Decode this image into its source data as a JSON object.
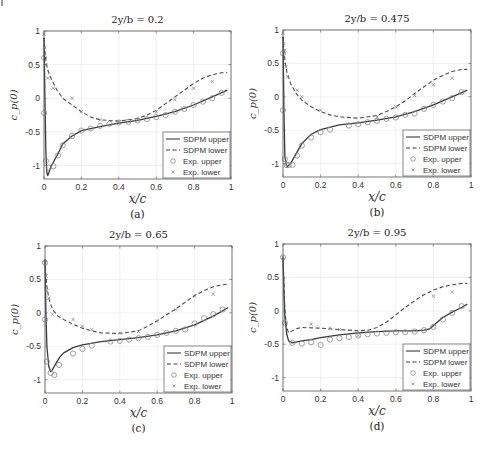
{
  "figure": {
    "colors": {
      "upper": "#3a3a3a",
      "lower": "#4a4a4a",
      "exp": "#888888",
      "grid": "#e6e6e6",
      "axis": "#555555"
    }
  },
  "chart_data": [
    {
      "type": "line",
      "caption": "(a)",
      "title": "2y/b = 0.2",
      "xlabel": "x/c",
      "ylabel": "c_p(0)",
      "xlim": [
        0,
        1
      ],
      "ylim": [
        -1.2,
        1
      ],
      "xticks": [
        0,
        0.2,
        0.4,
        0.6,
        0.8,
        1
      ],
      "xtick_labels": [
        "0",
        "0.2",
        "0.4",
        "0.6",
        "0.8",
        "1"
      ],
      "yticks": [
        -1,
        -0.5,
        0,
        0.5,
        1
      ],
      "ytick_labels": [
        "-1",
        "-0.5",
        "0",
        "0.5",
        "1"
      ],
      "grid": true,
      "legend": [
        "SDPM upper",
        "SDPM lower",
        "Exp. upper",
        "Exp. lower"
      ],
      "legend_position": "lower right",
      "series": [
        {
          "name": "SDPM upper",
          "style": "solid",
          "x": [
            0,
            0.005,
            0.01,
            0.015,
            0.02,
            0.04,
            0.07,
            0.1,
            0.15,
            0.2,
            0.3,
            0.4,
            0.5,
            0.6,
            0.7,
            0.8,
            0.9,
            0.98
          ],
          "y": [
            0.9,
            0.0,
            -0.8,
            -1.1,
            -1.15,
            -1.0,
            -0.85,
            -0.68,
            -0.56,
            -0.48,
            -0.42,
            -0.37,
            -0.33,
            -0.27,
            -0.2,
            -0.1,
            0.02,
            0.12
          ]
        },
        {
          "name": "SDPM lower",
          "style": "dashed",
          "x": [
            0,
            0.005,
            0.01,
            0.02,
            0.04,
            0.07,
            0.1,
            0.15,
            0.2,
            0.25,
            0.3,
            0.4,
            0.5,
            0.55,
            0.6,
            0.65,
            0.7,
            0.75,
            0.8,
            0.85,
            0.9,
            0.95,
            0.98
          ],
          "y": [
            0.9,
            0.7,
            0.55,
            0.42,
            0.28,
            0.12,
            0.0,
            -0.1,
            -0.2,
            -0.28,
            -0.32,
            -0.34,
            -0.3,
            -0.25,
            -0.18,
            -0.08,
            0.02,
            0.12,
            0.22,
            0.3,
            0.35,
            0.38,
            0.38
          ]
        },
        {
          "name": "Exp. upper",
          "style": "circle",
          "x": [
            0,
            0.0,
            0.01,
            0.025,
            0.05,
            0.075,
            0.1,
            0.15,
            0.2,
            0.25,
            0.3,
            0.35,
            0.4,
            0.45,
            0.5,
            0.55,
            0.6,
            0.65,
            0.7,
            0.75,
            0.8,
            0.85,
            0.9,
            0.95
          ],
          "y": [
            0.6,
            -0.22,
            -0.93,
            -1.03,
            -1.01,
            -0.85,
            -0.7,
            -0.56,
            -0.48,
            -0.45,
            -0.41,
            -0.38,
            -0.36,
            -0.35,
            -0.33,
            -0.31,
            -0.28,
            -0.25,
            -0.2,
            -0.16,
            -0.1,
            -0.05,
            0.0,
            0.08
          ]
        },
        {
          "name": "Exp. lower",
          "style": "x",
          "x": [
            0,
            0.005,
            0.01,
            0.02,
            0.05,
            0.15,
            0.2,
            0.3,
            0.4,
            0.5,
            0.6,
            0.7,
            0.8,
            0.9
          ],
          "y": [
            0.95,
            0.75,
            0.5,
            0.3,
            0.15,
            0.0,
            -0.2,
            -0.32,
            -0.35,
            -0.32,
            -0.2,
            -0.02,
            0.15,
            0.25
          ]
        }
      ]
    },
    {
      "type": "line",
      "caption": "(b)",
      "title": "2y/b = 0.475",
      "xlabel": "x/c",
      "ylabel": "c_p(0)",
      "xlim": [
        0,
        1
      ],
      "ylim": [
        -1.2,
        1
      ],
      "xticks": [
        0,
        0.2,
        0.4,
        0.6,
        0.8,
        1
      ],
      "xtick_labels": [
        "0",
        "0.2",
        "0.4",
        "0.6",
        "0.8",
        "1"
      ],
      "yticks": [
        -1,
        -0.5,
        0,
        0.5,
        1
      ],
      "ytick_labels": [
        "-1",
        "-0.5",
        "0",
        "0.5",
        "1"
      ],
      "grid": true,
      "legend": [
        "SDPM upper",
        "SDPM lower",
        "Exp. upper",
        "Exp. lower"
      ],
      "legend_position": "lower right",
      "series": [
        {
          "name": "SDPM upper",
          "style": "solid",
          "x": [
            0,
            0.005,
            0.01,
            0.02,
            0.04,
            0.07,
            0.1,
            0.15,
            0.2,
            0.3,
            0.4,
            0.5,
            0.6,
            0.7,
            0.8,
            0.9,
            0.98
          ],
          "y": [
            0.9,
            -0.2,
            -0.9,
            -1.05,
            -1.0,
            -0.85,
            -0.7,
            -0.56,
            -0.49,
            -0.42,
            -0.39,
            -0.35,
            -0.3,
            -0.22,
            -0.12,
            0.0,
            0.1
          ]
        },
        {
          "name": "SDPM lower",
          "style": "dashed",
          "x": [
            0,
            0.005,
            0.01,
            0.02,
            0.04,
            0.07,
            0.1,
            0.15,
            0.2,
            0.25,
            0.3,
            0.4,
            0.5,
            0.55,
            0.6,
            0.65,
            0.7,
            0.75,
            0.8,
            0.85,
            0.9,
            0.95,
            0.98
          ],
          "y": [
            0.9,
            0.7,
            0.55,
            0.38,
            0.2,
            0.05,
            -0.05,
            -0.15,
            -0.22,
            -0.27,
            -0.3,
            -0.32,
            -0.28,
            -0.22,
            -0.15,
            -0.06,
            0.05,
            0.15,
            0.25,
            0.32,
            0.38,
            0.41,
            0.41
          ]
        },
        {
          "name": "Exp. upper",
          "style": "circle",
          "x": [
            0,
            0.0,
            0.01,
            0.02,
            0.03,
            0.05,
            0.075,
            0.1,
            0.15,
            0.2,
            0.25,
            0.35,
            0.4,
            0.45,
            0.5,
            0.55,
            0.6,
            0.65,
            0.7,
            0.75,
            0.8,
            0.85,
            0.9,
            0.95
          ],
          "y": [
            0.65,
            -0.2,
            -0.93,
            -1.02,
            -1.02,
            -1.02,
            -0.88,
            -0.73,
            -0.61,
            -0.53,
            -0.49,
            -0.43,
            -0.41,
            -0.38,
            -0.36,
            -0.33,
            -0.31,
            -0.27,
            -0.25,
            -0.18,
            -0.12,
            -0.07,
            -0.02,
            0.07
          ]
        },
        {
          "name": "Exp. lower",
          "style": "x",
          "x": [
            0,
            0.005,
            0.01,
            0.015,
            0.025,
            0.075,
            0.1,
            0.2,
            0.5,
            0.6,
            0.7,
            0.8,
            0.9
          ],
          "y": [
            0.95,
            0.8,
            0.7,
            0.45,
            0.3,
            0.1,
            0.0,
            -0.2,
            -0.3,
            -0.15,
            0.02,
            0.18,
            0.28
          ]
        }
      ]
    },
    {
      "type": "line",
      "caption": "(c)",
      "title": "2y/b = 0.65",
      "xlabel": "x/c",
      "ylabel": "c_p(0)",
      "xlim": [
        0,
        1
      ],
      "ylim": [
        -1.2,
        1
      ],
      "xticks": [
        0,
        0.2,
        0.4,
        0.6,
        0.8,
        1
      ],
      "xtick_labels": [
        "0",
        "0.2",
        "0.4",
        "0.6",
        "0.8",
        "1"
      ],
      "yticks": [
        -1,
        -0.5,
        0,
        0.5,
        1
      ],
      "ytick_labels": [
        "-1",
        "-0.5",
        "0",
        "0.5",
        "1"
      ],
      "grid": true,
      "legend": [
        "SDPM upper",
        "SDPM lower",
        "Exp. upper",
        "Exp. lower"
      ],
      "legend_position": "lower right",
      "series": [
        {
          "name": "SDPM upper",
          "style": "solid",
          "x": [
            0,
            0.005,
            0.01,
            0.02,
            0.03,
            0.04,
            0.06,
            0.08,
            0.1,
            0.15,
            0.2,
            0.3,
            0.4,
            0.5,
            0.6,
            0.7,
            0.8,
            0.9,
            0.98
          ],
          "y": [
            0.8,
            0.0,
            -0.5,
            -0.8,
            -0.88,
            -0.85,
            -0.75,
            -0.66,
            -0.6,
            -0.52,
            -0.48,
            -0.43,
            -0.4,
            -0.37,
            -0.33,
            -0.27,
            -0.18,
            -0.05,
            0.08
          ]
        },
        {
          "name": "SDPM lower",
          "style": "dashed",
          "x": [
            0,
            0.005,
            0.01,
            0.02,
            0.04,
            0.07,
            0.1,
            0.15,
            0.2,
            0.25,
            0.3,
            0.4,
            0.5,
            0.55,
            0.6,
            0.65,
            0.7,
            0.75,
            0.8,
            0.85,
            0.9,
            0.95,
            0.98
          ],
          "y": [
            0.8,
            0.55,
            0.4,
            0.22,
            0.05,
            -0.05,
            -0.1,
            -0.17,
            -0.23,
            -0.27,
            -0.3,
            -0.31,
            -0.27,
            -0.2,
            -0.12,
            -0.03,
            0.06,
            0.16,
            0.26,
            0.33,
            0.39,
            0.42,
            0.43
          ]
        },
        {
          "name": "Exp. upper",
          "style": "circle",
          "x": [
            0,
            0.0,
            0.01,
            0.03,
            0.05,
            0.075,
            0.15,
            0.2,
            0.25,
            0.35,
            0.4,
            0.45,
            0.5,
            0.55,
            0.6,
            0.65,
            0.7,
            0.75,
            0.8,
            0.85,
            0.9,
            0.95
          ],
          "y": [
            0.75,
            -0.1,
            -0.73,
            -0.9,
            -0.93,
            -0.78,
            -0.61,
            -0.54,
            -0.49,
            -0.43,
            -0.42,
            -0.4,
            -0.38,
            -0.36,
            -0.33,
            -0.3,
            -0.27,
            -0.25,
            -0.16,
            -0.08,
            -0.02,
            0.05
          ]
        },
        {
          "name": "Exp. lower",
          "style": "x",
          "x": [
            0,
            0.005,
            0.01,
            0.02,
            0.04,
            0.15,
            0.2,
            0.25,
            0.4,
            0.5,
            0.6,
            0.7,
            0.8,
            0.9
          ],
          "y": [
            0.75,
            0.55,
            0.33,
            0.22,
            -0.02,
            -0.1,
            -0.2,
            -0.25,
            -0.3,
            -0.28,
            -0.12,
            0.05,
            0.25,
            0.28
          ]
        }
      ]
    },
    {
      "type": "line",
      "caption": "(d)",
      "title": "2y/b = 0.95",
      "xlabel": "x/c",
      "ylabel": "c_p(0)",
      "xlim": [
        0,
        1
      ],
      "ylim": [
        -1.2,
        1
      ],
      "xticks": [
        0,
        0.2,
        0.4,
        0.6,
        0.8,
        1
      ],
      "xtick_labels": [
        "0",
        "0.2",
        "0.4",
        "0.6",
        "0.8",
        "1"
      ],
      "yticks": [
        -1,
        -0.5,
        0,
        0.5,
        1
      ],
      "ytick_labels": [
        "-1",
        "-0.5",
        "0",
        "0.5",
        "1"
      ],
      "grid": true,
      "legend": [
        "SDPM upper",
        "SDPM lower",
        "Exp. upper",
        "Exp. lower"
      ],
      "legend_position": "lower right",
      "series": [
        {
          "name": "SDPM upper",
          "style": "solid",
          "x": [
            0,
            0.005,
            0.01,
            0.02,
            0.03,
            0.05,
            0.08,
            0.1,
            0.15,
            0.2,
            0.3,
            0.4,
            0.5,
            0.6,
            0.7,
            0.75,
            0.78,
            0.8,
            0.85,
            0.9,
            0.95,
            0.98
          ],
          "y": [
            0.8,
            0.3,
            -0.1,
            -0.35,
            -0.45,
            -0.48,
            -0.46,
            -0.45,
            -0.43,
            -0.4,
            -0.36,
            -0.33,
            -0.31,
            -0.3,
            -0.3,
            -0.29,
            -0.27,
            -0.22,
            -0.1,
            -0.02,
            0.05,
            0.1
          ]
        },
        {
          "name": "SDPM lower",
          "style": "dashed",
          "x": [
            0,
            0.005,
            0.01,
            0.02,
            0.03,
            0.05,
            0.08,
            0.1,
            0.2,
            0.3,
            0.4,
            0.45,
            0.5,
            0.55,
            0.6,
            0.65,
            0.7,
            0.75,
            0.8,
            0.85,
            0.9,
            0.95,
            0.98
          ],
          "y": [
            0.8,
            0.4,
            0.0,
            -0.25,
            -0.33,
            -0.3,
            -0.26,
            -0.25,
            -0.26,
            -0.28,
            -0.3,
            -0.29,
            -0.25,
            -0.17,
            -0.06,
            0.05,
            0.15,
            0.24,
            0.31,
            0.36,
            0.39,
            0.41,
            0.41
          ]
        },
        {
          "name": "Exp. upper",
          "style": "circle",
          "x": [
            0,
            0.01,
            0.05,
            0.1,
            0.15,
            0.2,
            0.25,
            0.3,
            0.35,
            0.4,
            0.45,
            0.5,
            0.55,
            0.6,
            0.65,
            0.7,
            0.75,
            0.8,
            0.85,
            0.9,
            0.95
          ],
          "y": [
            0.8,
            -0.18,
            -0.48,
            -0.49,
            -0.47,
            -0.51,
            -0.43,
            -0.41,
            -0.39,
            -0.37,
            -0.35,
            -0.34,
            -0.33,
            -0.32,
            -0.32,
            -0.31,
            -0.29,
            -0.24,
            -0.13,
            -0.03,
            0.07
          ]
        },
        {
          "name": "Exp. lower",
          "style": "x",
          "x": [
            0,
            0.01,
            0.15,
            0.25,
            0.3,
            0.4,
            0.8,
            0.9
          ],
          "y": [
            0.8,
            -0.18,
            -0.2,
            -0.26,
            -0.28,
            -0.37,
            0.22,
            0.28
          ]
        }
      ]
    }
  ],
  "layout": [
    {
      "left": 44,
      "right": 231,
      "top": 31,
      "bottom": 179,
      "cx": 138
    },
    {
      "left": 283,
      "right": 471,
      "top": 30,
      "bottom": 177,
      "cx": 377
    },
    {
      "left": 45,
      "right": 232,
      "top": 246,
      "bottom": 393,
      "cx": 138
    },
    {
      "left": 283,
      "right": 471,
      "top": 244,
      "bottom": 391,
      "cx": 377
    }
  ]
}
